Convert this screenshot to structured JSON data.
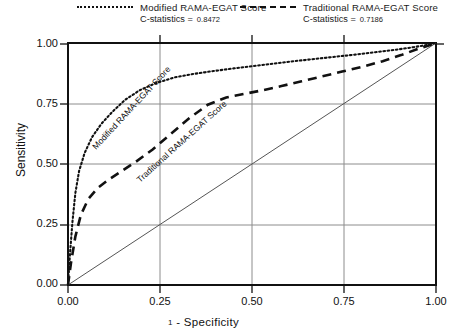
{
  "legend": {
    "entries": [
      {
        "name": "modified",
        "label": "Modified RAMA-EGAT Score",
        "stat_label": "C-statistics  =",
        "stat_value": "0.8472",
        "style": "dotted"
      },
      {
        "name": "traditional",
        "label": "Traditional RAMA-EGAT Score",
        "stat_label": "C-statistics  =",
        "stat_value": "0.7186",
        "style": "dashed"
      }
    ]
  },
  "axes": {
    "ylabel": "Sensitivity",
    "xlabel_lead": "1",
    "xlabel": "- Specificity",
    "yticks": [
      "0.00",
      "0.25",
      "0.50",
      "0.75",
      "1.00"
    ],
    "xticks": [
      "0.00",
      "0.25",
      "0.50",
      "0.75",
      "1.00"
    ]
  },
  "inline_labels": {
    "modified": "Modified RAMA-EGAT Score",
    "traditional": "Traditional RAMA-EGAT Score"
  },
  "chart_data": {
    "type": "line",
    "title": "",
    "xlabel": "1 - Specificity",
    "ylabel": "Sensitivity",
    "xlim": [
      0,
      1
    ],
    "ylim": [
      0,
      1
    ],
    "grid": true,
    "legend_position": "above-plot",
    "reference_line": {
      "name": "chance-diagonal",
      "x": [
        0,
        1
      ],
      "y": [
        0,
        1
      ],
      "style": "solid"
    },
    "series": [
      {
        "name": "Modified RAMA-EGAT Score",
        "style": "dotted",
        "c_statistic": 0.8472,
        "x": [
          0.0,
          0.005,
          0.012,
          0.02,
          0.03,
          0.045,
          0.065,
          0.09,
          0.12,
          0.155,
          0.195,
          0.24,
          0.29,
          0.34,
          0.395,
          0.45,
          0.505,
          0.56,
          0.615,
          0.67,
          0.725,
          0.78,
          0.835,
          0.89,
          0.94,
          0.975,
          1.0
        ],
        "y": [
          0.0,
          0.12,
          0.26,
          0.38,
          0.47,
          0.545,
          0.61,
          0.665,
          0.715,
          0.765,
          0.805,
          0.835,
          0.858,
          0.872,
          0.884,
          0.895,
          0.905,
          0.915,
          0.925,
          0.934,
          0.943,
          0.952,
          0.962,
          0.972,
          0.983,
          0.992,
          1.0
        ]
      },
      {
        "name": "Traditional RAMA-EGAT Score",
        "style": "dashed",
        "c_statistic": 0.7186,
        "x": [
          0.0,
          0.008,
          0.02,
          0.035,
          0.055,
          0.08,
          0.11,
          0.145,
          0.185,
          0.23,
          0.28,
          0.33,
          0.38,
          0.43,
          0.48,
          0.53,
          0.58,
          0.635,
          0.69,
          0.745,
          0.8,
          0.855,
          0.905,
          0.95,
          0.98,
          1.0
        ],
        "y": [
          0.0,
          0.09,
          0.2,
          0.29,
          0.355,
          0.4,
          0.435,
          0.47,
          0.51,
          0.56,
          0.625,
          0.69,
          0.745,
          0.775,
          0.79,
          0.805,
          0.822,
          0.842,
          0.862,
          0.882,
          0.902,
          0.925,
          0.95,
          0.975,
          0.99,
          1.0
        ]
      }
    ]
  }
}
